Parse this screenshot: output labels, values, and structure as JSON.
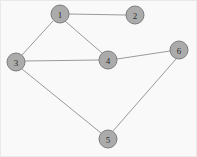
{
  "figure": {
    "kind": "undirected-graph",
    "width": 197,
    "height": 157,
    "background_color": "#f9f9f9",
    "border_color": "#e9e9e9"
  },
  "style": {
    "node_fill": "#ababab",
    "node_stroke": "#7c7c7c",
    "node_radius": 9,
    "edge_color": "#9a9a9a",
    "edge_width": 1,
    "label_color": "#2b2b2b"
  },
  "nodes": [
    {
      "id": "1",
      "label": "1",
      "cx": 59,
      "cy": 13
    },
    {
      "id": "2",
      "label": "2",
      "cx": 134,
      "cy": 14
    },
    {
      "id": "3",
      "label": "3",
      "cx": 15,
      "cy": 61
    },
    {
      "id": "4",
      "label": "4",
      "cx": 107,
      "cy": 59
    },
    {
      "id": "5",
      "label": "5",
      "cx": 107,
      "cy": 138
    },
    {
      "id": "6",
      "label": "6",
      "cx": 178,
      "cy": 49
    }
  ],
  "edges": [
    {
      "id": "1-2",
      "source": "1",
      "target": "2",
      "x1": 68,
      "y1": 13,
      "x2": 125,
      "y2": 14
    },
    {
      "id": "1-3",
      "source": "1",
      "target": "3",
      "x1": 52,
      "y1": 20,
      "x2": 21,
      "y2": 54
    },
    {
      "id": "1-4",
      "source": "1",
      "target": "4",
      "x1": 64,
      "y1": 20,
      "x2": 101,
      "y2": 52
    },
    {
      "id": "3-4",
      "source": "3",
      "target": "4",
      "x1": 24,
      "y1": 60,
      "x2": 98,
      "y2": 59
    },
    {
      "id": "3-5",
      "source": "3",
      "target": "5",
      "x1": 21,
      "y1": 68,
      "x2": 100,
      "y2": 132
    },
    {
      "id": "4-6",
      "source": "4",
      "target": "6",
      "x1": 116,
      "y1": 58,
      "x2": 169,
      "y2": 50
    },
    {
      "id": "5-6",
      "source": "5",
      "target": "6",
      "x1": 112,
      "y1": 130,
      "x2": 175,
      "y2": 58
    }
  ]
}
